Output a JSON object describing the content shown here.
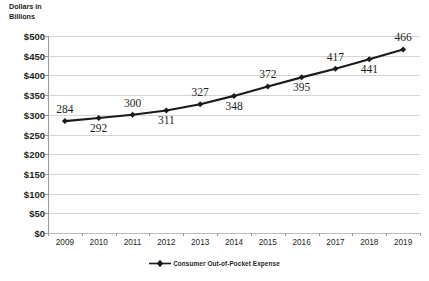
{
  "chart_data": {
    "type": "line",
    "title": "",
    "xlabel": "",
    "ylabel": "Dollars in\nBillions",
    "categories": [
      "2009",
      "2010",
      "2011",
      "2012",
      "2013",
      "2014",
      "2015",
      "2016",
      "2017",
      "2018",
      "2019"
    ],
    "values": [
      284,
      292,
      300,
      311,
      327,
      348,
      372,
      395,
      417,
      441,
      466
    ],
    "series": [
      {
        "name": "Consumer Out-of-Pocket Expense",
        "values": [
          284,
          292,
          300,
          311,
          327,
          348,
          372,
          395,
          417,
          441,
          466
        ]
      }
    ],
    "data_labels": [
      "284",
      "292",
      "300",
      "311",
      "327",
      "348",
      "372",
      "395",
      "417",
      "441",
      "466"
    ],
    "data_label_positions": [
      "above",
      "below",
      "above",
      "below",
      "above",
      "below",
      "above",
      "below",
      "above",
      "below",
      "above"
    ],
    "ylim": [
      0,
      500
    ],
    "ytick_step": 50,
    "ytick_labels": [
      "$500",
      "$450",
      "$400",
      "$350",
      "$300",
      "$250",
      "$200",
      "$150",
      "$100",
      "$50",
      "$0"
    ],
    "ytick_values": [
      500,
      450,
      400,
      350,
      300,
      250,
      200,
      150,
      100,
      50,
      0
    ],
    "grid": true,
    "legend_position": "bottom",
    "colors": {
      "series_line": "#1a1a1a",
      "marker": "#1a1a1a",
      "gridline": "#d4d4d4",
      "axis": "#9a9a9a",
      "text": "#231f20",
      "background": "#ffffff"
    }
  },
  "legend": {
    "entries": [
      {
        "label": "Consumer Out-of-Pocket Expense",
        "marker": "diamond-line-marker"
      }
    ]
  },
  "axis_title": {
    "line1": "Dollars in",
    "line2": "Billions"
  }
}
